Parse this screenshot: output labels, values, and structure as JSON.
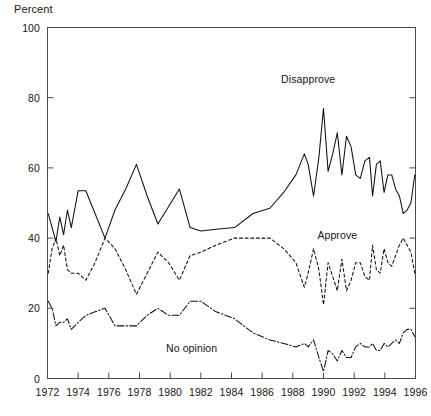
{
  "chart_data": {
    "type": "line",
    "title": "",
    "xlabel": "",
    "ylabel": "Percent",
    "ylim": [
      0,
      100
    ],
    "xlim": [
      1972,
      1996
    ],
    "yticks": [
      0,
      20,
      40,
      60,
      80,
      100
    ],
    "ytick_labels": [
      "0",
      "20",
      "40",
      "60",
      "80",
      "100"
    ],
    "xticks": [
      1972,
      1974,
      1976,
      1978,
      1980,
      1982,
      1984,
      1986,
      1988,
      1990,
      1992,
      1994,
      1996
    ],
    "xtick_labels": [
      "1972",
      "1974",
      "1976",
      "1978",
      "1980",
      "1982",
      "1984",
      "1986",
      "1988",
      "1990",
      "1992",
      "1994",
      "1996"
    ],
    "grid": false,
    "legend_position": "inline-annotations",
    "annotations": [
      {
        "text": "Disapprove",
        "x": 1989.0,
        "y": 85
      },
      {
        "text": "Approve",
        "x": 1990.9,
        "y": 40.5
      },
      {
        "text": "No opinion",
        "x": 1981.4,
        "y": 8.5
      }
    ],
    "series": [
      {
        "name": "Disapprove",
        "style": "solid",
        "x": [
          1972.05,
          1972.3,
          1972.55,
          1972.8,
          1973.05,
          1973.3,
          1973.55,
          1974.0,
          1974.5,
          1975.1,
          1975.75,
          1976.4,
          1977.1,
          1977.8,
          1978.5,
          1979.2,
          1979.9,
          1980.6,
          1981.3,
          1982.0,
          1983.0,
          1984.2,
          1985.4,
          1986.5,
          1987.4,
          1988.2,
          1988.75,
          1989.0,
          1989.35,
          1989.7,
          1990.0,
          1990.3,
          1990.6,
          1990.9,
          1991.2,
          1991.5,
          1991.8,
          1992.1,
          1992.4,
          1992.7,
          1993.0,
          1993.2,
          1993.45,
          1993.7,
          1993.95,
          1994.2,
          1994.45,
          1994.7,
          1994.95,
          1995.2,
          1995.45,
          1995.7,
          1995.95
        ],
        "y": [
          47,
          43,
          39,
          46,
          41,
          48,
          43,
          53.5,
          53.5,
          47,
          40,
          48,
          54,
          61,
          52,
          44,
          49,
          54,
          43,
          42,
          42.5,
          43,
          47,
          48.5,
          53,
          58,
          64,
          61,
          52,
          63,
          77,
          59,
          64,
          70,
          58,
          69,
          66,
          58,
          57,
          62,
          63,
          52,
          61,
          62,
          53,
          58,
          58,
          54,
          52,
          47,
          48,
          50,
          58
        ]
      },
      {
        "name": "Approve",
        "style": "dashed",
        "x": [
          1972.05,
          1972.3,
          1972.55,
          1972.8,
          1973.05,
          1973.3,
          1973.55,
          1974.0,
          1974.5,
          1975.1,
          1975.75,
          1976.4,
          1977.1,
          1977.8,
          1978.5,
          1979.2,
          1979.9,
          1980.6,
          1981.3,
          1982.0,
          1983.0,
          1984.2,
          1985.4,
          1986.5,
          1987.4,
          1988.2,
          1988.75,
          1989.0,
          1989.35,
          1989.7,
          1990.0,
          1990.3,
          1990.6,
          1990.9,
          1991.2,
          1991.5,
          1991.8,
          1992.1,
          1992.4,
          1992.7,
          1993.0,
          1993.2,
          1993.45,
          1993.7,
          1993.95,
          1994.2,
          1994.45,
          1994.7,
          1994.95,
          1995.2,
          1995.45,
          1995.7,
          1995.95
        ],
        "y": [
          30,
          37,
          40,
          35,
          38,
          31,
          30,
          30,
          28,
          33,
          40,
          37,
          31,
          24,
          30,
          36,
          33,
          28,
          35,
          36,
          38,
          40,
          40,
          40,
          37,
          33,
          26,
          30,
          37,
          31,
          21,
          33,
          29,
          25,
          34,
          25,
          28,
          33,
          33,
          29,
          28,
          38,
          31,
          30,
          37,
          33,
          32,
          35,
          38,
          40,
          38,
          36,
          30
        ]
      },
      {
        "name": "No opinion",
        "style": "dashdot",
        "x": [
          1972.05,
          1972.3,
          1972.55,
          1972.8,
          1973.05,
          1973.3,
          1973.55,
          1974.0,
          1974.5,
          1975.1,
          1975.75,
          1976.4,
          1977.1,
          1977.8,
          1978.5,
          1979.2,
          1979.9,
          1980.6,
          1981.3,
          1982.0,
          1983.0,
          1984.2,
          1985.4,
          1986.5,
          1987.4,
          1988.2,
          1988.75,
          1989.0,
          1989.35,
          1989.7,
          1990.0,
          1990.3,
          1990.6,
          1990.9,
          1991.2,
          1991.5,
          1991.8,
          1992.1,
          1992.4,
          1992.7,
          1993.0,
          1993.2,
          1993.45,
          1993.7,
          1993.95,
          1994.2,
          1994.45,
          1994.7,
          1994.95,
          1995.2,
          1995.45,
          1995.7,
          1995.95
        ],
        "y": [
          22,
          20,
          15,
          16,
          16,
          17,
          14,
          16,
          18,
          19,
          20,
          15,
          15,
          15,
          18,
          20,
          18,
          18,
          22,
          22,
          19,
          17,
          13,
          11,
          10,
          9,
          10,
          9,
          11,
          6,
          2,
          8,
          7,
          5,
          8,
          6,
          6,
          9,
          10,
          9,
          9,
          10,
          8,
          8,
          10,
          9,
          10,
          11,
          10,
          13,
          14,
          14,
          12
        ]
      }
    ]
  }
}
